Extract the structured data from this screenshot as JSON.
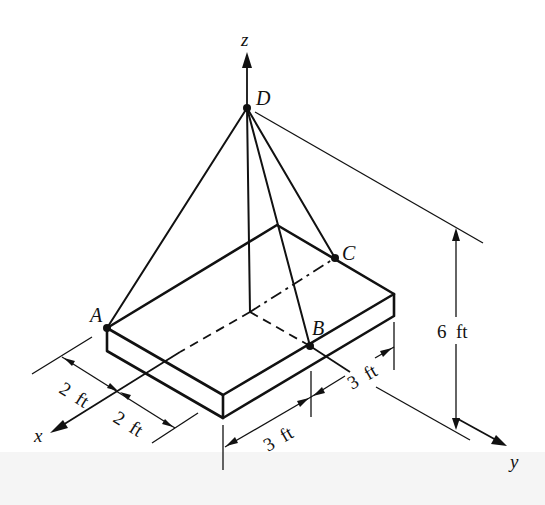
{
  "figure": {
    "axes": {
      "x": {
        "label": "x"
      },
      "y": {
        "label": "y"
      },
      "z": {
        "label": "z"
      }
    },
    "points": {
      "A": {
        "label": "A"
      },
      "B": {
        "label": "B"
      },
      "C": {
        "label": "C"
      },
      "D": {
        "label": "D"
      }
    },
    "dimensions": {
      "x_segment_1": {
        "value": "2",
        "unit": "ft"
      },
      "x_segment_2": {
        "value": "2",
        "unit": "ft"
      },
      "y_segment_1": {
        "value": "3",
        "unit": "ft"
      },
      "y_segment_2": {
        "value": "3",
        "unit": "ft"
      },
      "z_height": {
        "value": "6",
        "unit": "ft"
      }
    },
    "labels": {
      "dim_x1": "2  ft",
      "dim_x2": "2  ft",
      "dim_y1": "3  ft",
      "dim_y2": "3  ft",
      "dim_z": "6  ft"
    },
    "colors": {
      "ink": "#111111",
      "background": "#ffffff",
      "lower_band": "#f5f5f5"
    }
  }
}
